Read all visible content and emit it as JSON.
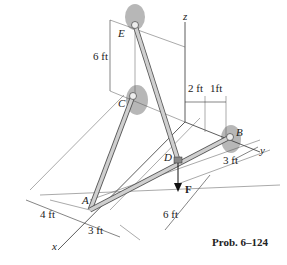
{
  "figure": {
    "caption": "Prob. 6–124",
    "axes": {
      "x": "x",
      "y": "y",
      "z": "z"
    },
    "points": {
      "A": "A",
      "B": "B",
      "C": "C",
      "D": "D",
      "E": "E"
    },
    "force": {
      "label": "F",
      "direction": "down"
    },
    "dimensions": {
      "e_to_c": "6 ft",
      "z_to_d": "2 ft",
      "d_to_b": "1ft",
      "b_offset": "3 ft",
      "a_to_d": "6 ft",
      "x_a_left": "4 ft",
      "x_a_right": "3 ft"
    },
    "colors": {
      "member": "#c8c8c8",
      "shadow": "#9a9a9a",
      "line": "#444444"
    }
  }
}
